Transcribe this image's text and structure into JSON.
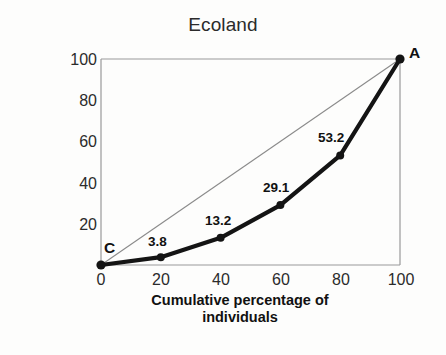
{
  "chart_data": {
    "type": "line",
    "title": "Ecoland",
    "xlabel": "Cumulative percentage of individuals",
    "xlabel_line1": "Cumulative percentage of",
    "xlabel_line2": "individuals",
    "ylabel": "Cumulative percentage of income",
    "ylabel_line1": "Cumulative percentage of",
    "ylabel_line2": "income",
    "xlim": [
      0,
      100
    ],
    "ylim": [
      0,
      100
    ],
    "xticks": [
      0,
      20,
      40,
      60,
      80,
      100
    ],
    "yticks": [
      20,
      40,
      60,
      80,
      100
    ],
    "xtick_labels": [
      "0",
      "20",
      "40",
      "60",
      "80",
      "100"
    ],
    "ytick_labels": [
      "20",
      "40",
      "60",
      "80",
      "100"
    ],
    "grid": false,
    "legend": "none",
    "series": [
      {
        "name": "Lorenz curve",
        "style": "thick-black-with-markers",
        "color": "#141414",
        "x": [
          0,
          20,
          40,
          60,
          80,
          100
        ],
        "values": [
          0,
          3.8,
          13.2,
          29.1,
          53.2,
          100
        ],
        "point_labels": [
          "",
          "3.8",
          "13.2",
          "29.1",
          "53.2",
          ""
        ]
      },
      {
        "name": "Line of equality",
        "style": "thin-gray",
        "color": "#8a8a8a",
        "x": [
          0,
          100
        ],
        "values": [
          0,
          100
        ],
        "point_labels": [
          "",
          ""
        ]
      }
    ],
    "annotations": [
      {
        "text": "C",
        "x": 0,
        "y": 0,
        "note": "origin endpoint of Lorenz curve"
      },
      {
        "text": "A",
        "x": 100,
        "y": 100,
        "note": "upper endpoint of Lorenz curve"
      }
    ]
  },
  "colors": {
    "background": "#fdfdfc",
    "curve": "#141414",
    "equality_line": "#8a8a8a",
    "frame": "#9a9a9a",
    "text": "#1a1a1a"
  }
}
